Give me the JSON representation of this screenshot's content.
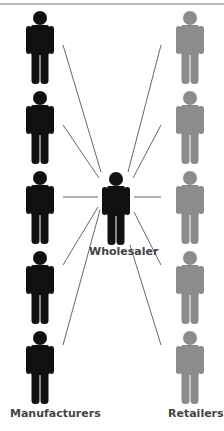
{
  "diagram": {
    "title": "",
    "nodes": {
      "manufacturers": {
        "label": "Manufacturers",
        "count": 5,
        "color": "#111111"
      },
      "wholesaler": {
        "label": "Wholesaler",
        "count": 1,
        "color": "#111111"
      },
      "retailers": {
        "label": "Retailers",
        "count": 5,
        "color": "#8c8c8c"
      }
    },
    "edges": "Each manufacturer connects to the wholesaler; the wholesaler connects to each retailer",
    "colors": {
      "line": "#555555",
      "top_rule": "#777777",
      "label": "#444444"
    }
  }
}
